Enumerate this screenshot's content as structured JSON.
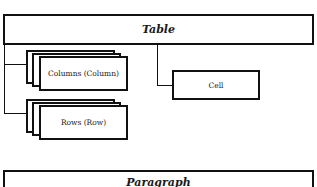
{
  "diagram": {
    "root": {
      "label": "Table"
    },
    "children": [
      {
        "label": "Columns (Column)",
        "kind": "collection"
      },
      {
        "label": "Rows (Row)",
        "kind": "collection"
      },
      {
        "label": "Cell",
        "kind": "single"
      }
    ],
    "next_root": {
      "label": "Paragraph"
    }
  }
}
